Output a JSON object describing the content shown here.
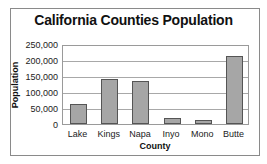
{
  "chart_data": {
    "type": "bar",
    "title": "California Counties Population",
    "xlabel": "County",
    "ylabel": "Population",
    "categories": [
      "Lake",
      "Kings",
      "Napa",
      "Inyo",
      "Mono",
      "Butte"
    ],
    "values": [
      63000,
      140000,
      133000,
      18000,
      13000,
      212000
    ],
    "ylim": [
      0,
      250000
    ],
    "yticks": [
      0,
      50000,
      100000,
      150000,
      200000,
      250000
    ],
    "ytick_labels": [
      "0",
      "50,000",
      "100,000",
      "150,000",
      "200,000",
      "250,000"
    ],
    "grid": true,
    "legend": null,
    "colors": {
      "bar_fill": "#a6a6a6",
      "bar_edge": "#555555",
      "grid": "#a8a8a8"
    }
  }
}
